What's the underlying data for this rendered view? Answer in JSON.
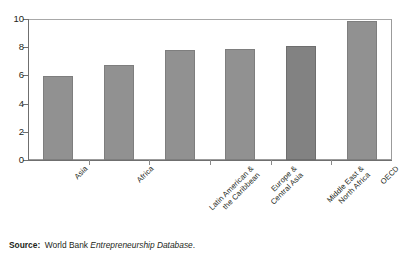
{
  "chart_data": {
    "type": "bar",
    "title": "",
    "subtitle": "",
    "xlabel": "",
    "ylabel": "",
    "ylim": [
      0,
      10
    ],
    "yticks": [
      "0",
      "2",
      "4",
      "6",
      "8",
      "10"
    ],
    "ytick_values": [
      0,
      2,
      4,
      6,
      8,
      10
    ],
    "grid": false,
    "legend": false,
    "legend_position": "none",
    "orientation": "vertical",
    "bar_color": "#919191",
    "bar_edge_color": "#7e7e7e",
    "categories": [
      "Asia",
      "Africa",
      "Latin American &\nthe Caribbean",
      "Europe &\nCentral Asia",
      "Middle East &\nNorth Africa",
      "OECD"
    ],
    "values": [
      5.95,
      6.75,
      7.8,
      7.85,
      8.1,
      9.85
    ]
  },
  "source": {
    "label": "Source:",
    "publisher": "World Bank",
    "publication": "Entrepreneurship Database",
    "terminator": "."
  },
  "colors": {
    "bar": "#919191",
    "bar_dark": "#828282",
    "axis": "#6f6f6f",
    "frame": "#9b9b9b",
    "text": "#231f20",
    "background": "#ffffff"
  }
}
